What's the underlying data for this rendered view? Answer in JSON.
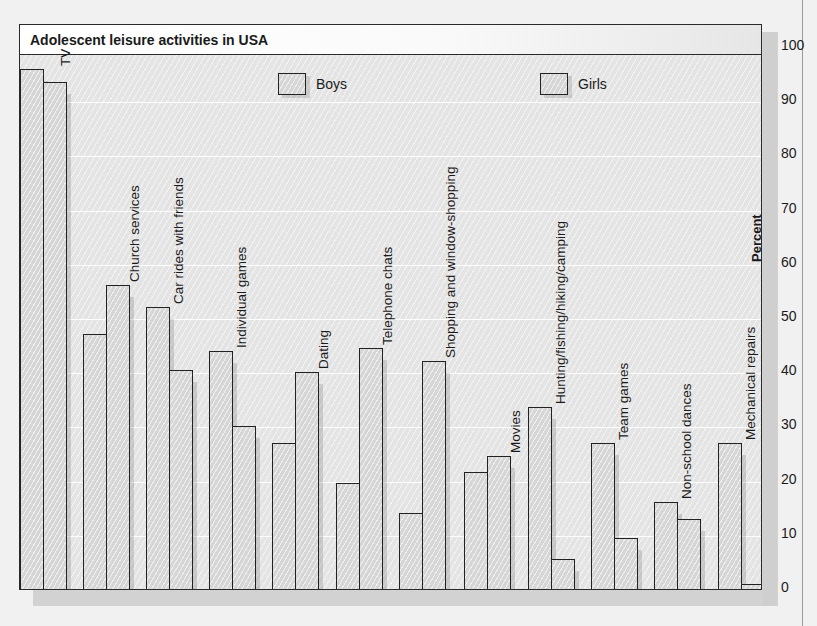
{
  "chart_data": {
    "type": "bar",
    "title": "Adolescent leisure activities in USA",
    "xlabel": "",
    "ylabel": "Percent",
    "ylim": [
      0,
      100
    ],
    "yticks": [
      0,
      10,
      20,
      30,
      40,
      50,
      60,
      70,
      80,
      90,
      100
    ],
    "grid": true,
    "legend_position": "top",
    "categories": [
      "TV",
      "Church services",
      "Car rides with friends",
      "Individual games",
      "Dating",
      "Telephone chats",
      "Shopping and window-shopping",
      "Movies",
      "Hunting/fishing/hiking/camping",
      "Team games",
      "Non-school dances",
      "Mechanical repairs"
    ],
    "series": [
      {
        "name": "Boys",
        "values": [
          96,
          47,
          52,
          44,
          27,
          19.5,
          14,
          21.5,
          33.5,
          27,
          16,
          27
        ]
      },
      {
        "name": "Girls",
        "values": [
          93.5,
          56,
          40.5,
          30,
          40,
          44.5,
          42,
          24.5,
          5.5,
          9.5,
          13,
          1
        ]
      }
    ]
  },
  "legend": [
    {
      "label": "Boys"
    },
    {
      "label": "Girls"
    }
  ],
  "y_axis": {
    "title": "Percent",
    "ticks": [
      "100",
      "90",
      "80",
      "70",
      "60",
      "50",
      "40",
      "30",
      "20",
      "10",
      "0"
    ]
  }
}
